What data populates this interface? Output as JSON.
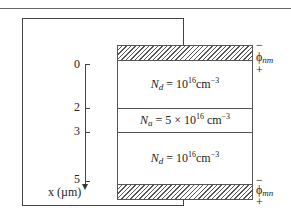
{
  "diagram": {
    "type": "semiconductor-layer-stack",
    "axis": {
      "label": "x (µm)",
      "ticks": [
        {
          "value": "0",
          "position_um": 0
        },
        {
          "value": "2",
          "position_um": 2
        },
        {
          "value": "3",
          "position_um": 3
        },
        {
          "value": "5",
          "position_um": 5
        }
      ]
    },
    "layers": [
      {
        "id": "top-contact",
        "kind": "metal contact",
        "label": ""
      },
      {
        "id": "layer1",
        "from_um": 0,
        "to_um": 2,
        "dopant_symbol": "N",
        "dopant_sub": "d",
        "doping_text": " = 10",
        "exp": "16",
        "unit": "cm",
        "unit_exp": "−3"
      },
      {
        "id": "layer2",
        "from_um": 2,
        "to_um": 3,
        "dopant_symbol": "N",
        "dopant_sub": "a",
        "doping_text": " = 5 × 10",
        "exp": "16",
        "unit": " cm",
        "unit_exp": "−3"
      },
      {
        "id": "layer3",
        "from_um": 3,
        "to_um": 5,
        "dopant_symbol": "N",
        "dopant_sub": "d",
        "doping_text": " = 10",
        "exp": "16",
        "unit": "cm",
        "unit_exp": "−3"
      },
      {
        "id": "bottom-contact",
        "kind": "metal contact",
        "label": ""
      }
    ],
    "contacts": {
      "top": {
        "symbol": "ϕ",
        "sub": "nm",
        "minus": "−",
        "plus": "+"
      },
      "bottom": {
        "symbol": "ϕ",
        "sub": "mn",
        "minus": "−",
        "plus": "+"
      }
    }
  }
}
